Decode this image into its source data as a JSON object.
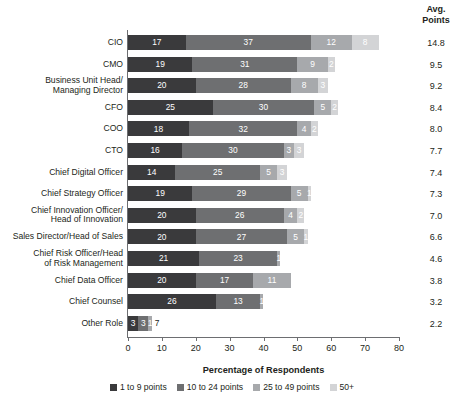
{
  "chart_data": {
    "type": "bar",
    "orientation": "horizontal",
    "stacked": true,
    "title": "",
    "xlabel": "Percentage of Respondents",
    "ylabel": "",
    "xlim": [
      0,
      80
    ],
    "xticks": [
      0,
      10,
      20,
      30,
      40,
      50,
      60,
      70,
      80
    ],
    "grid": false,
    "legend_position": "bottom",
    "categories": [
      "CIO",
      "CMO",
      "Business Unit Head/\nManaging Director",
      "CFO",
      "COO",
      "CTO",
      "Chief Digital Officer",
      "Chief Strategy Officer",
      "Chief Innovation Officer/\nHead of Innovation",
      "Sales Director/Head of Sales",
      "Chief Risk Officer/Head\nof Risk Management",
      "Chief Data Officer",
      "Chief Counsel",
      "Other Role"
    ],
    "series": [
      {
        "name": "1 to 9 points",
        "color": "#3a3a3c",
        "values": [
          17,
          19,
          20,
          25,
          18,
          16,
          14,
          19,
          20,
          20,
          21,
          20,
          26,
          3
        ]
      },
      {
        "name": "10 to 24 points",
        "color": "#6e6f71",
        "values": [
          37,
          31,
          28,
          30,
          32,
          30,
          25,
          29,
          26,
          27,
          23,
          17,
          13,
          3
        ]
      },
      {
        "name": "25 to 49 points",
        "color": "#a7a9ac",
        "values": [
          12,
          9,
          8,
          5,
          4,
          3,
          5,
          5,
          4,
          5,
          1,
          11,
          1,
          1
        ]
      },
      {
        "name": "50+",
        "color": "#d3d4d6",
        "values": [
          8,
          2,
          3,
          2,
          2,
          3,
          3,
          1,
          2,
          1,
          0,
          0,
          0,
          7
        ]
      }
    ],
    "annotations": {
      "avg_points_header": "Avg.\nPoints",
      "avg_points": [
        14.8,
        9.5,
        9.2,
        8.4,
        8.0,
        7.7,
        7.4,
        7.3,
        7.0,
        6.6,
        4.6,
        3.8,
        3.2,
        2.2
      ]
    }
  },
  "avg_column": {
    "header_line1": "Avg.",
    "header_line2": "Points"
  },
  "legend": {
    "items": [
      {
        "label": "1 to 9 points",
        "color": "#3a3a3c"
      },
      {
        "label": "10 to 24 points",
        "color": "#6e6f71"
      },
      {
        "label": "25 to 49 points",
        "color": "#a7a9ac"
      },
      {
        "label": "50+",
        "color": "#d3d4d6"
      }
    ]
  },
  "axis": {
    "x_title": "Percentage of Respondents"
  }
}
